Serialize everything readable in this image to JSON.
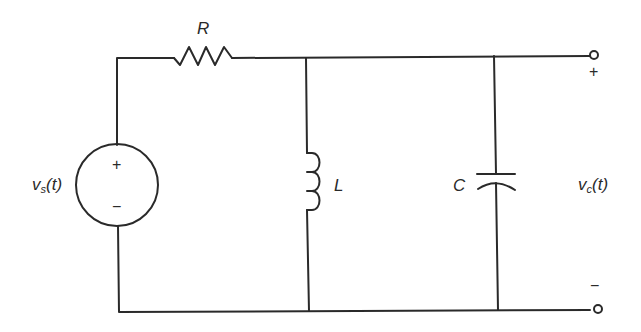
{
  "diagram": {
    "type": "circuit-schematic",
    "components": {
      "source": {
        "label_main": "v",
        "label_sub": "s",
        "label_arg": "(t)",
        "plus": "+",
        "minus": "−"
      },
      "resistor": {
        "label": "R"
      },
      "inductor": {
        "label": "L"
      },
      "capacitor": {
        "label": "C"
      },
      "output": {
        "label_main": "v",
        "label_sub": "c",
        "label_arg": "(t)",
        "plus": "+",
        "minus": "−"
      }
    },
    "colors": {
      "stroke": "#2a2a2a",
      "background": "#ffffff"
    }
  }
}
